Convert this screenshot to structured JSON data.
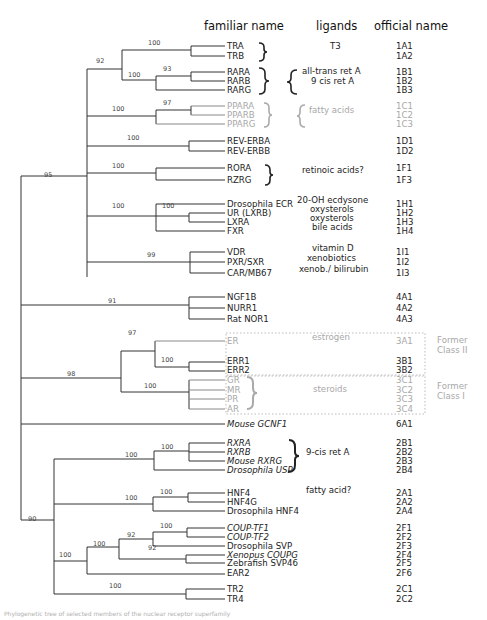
{
  "headers": {
    "familiar": "familiar name",
    "ligands": "ligands",
    "official": "official name"
  },
  "colors": {
    "line": "#333333",
    "gray": "#a8a8a8",
    "text": "#222222"
  },
  "leaves": [
    {
      "name": "TRA",
      "y": 46,
      "official": "1A1",
      "gray": false
    },
    {
      "name": "TRB",
      "y": 56,
      "official": "1A2",
      "gray": false
    },
    {
      "name": "RARA",
      "y": 72,
      "official": "1B1",
      "gray": false
    },
    {
      "name": "RARB",
      "y": 81,
      "official": "1B2",
      "gray": false
    },
    {
      "name": "RARG",
      "y": 90,
      "official": "1B3",
      "gray": false
    },
    {
      "name": "PPARA",
      "y": 106,
      "official": "1C1",
      "gray": true
    },
    {
      "name": "PPARB",
      "y": 115,
      "official": "1C2",
      "gray": true
    },
    {
      "name": "PPARG",
      "y": 124,
      "official": "1C3",
      "gray": true
    },
    {
      "name": "REV-ERBA",
      "y": 141,
      "official": "1D1",
      "gray": false
    },
    {
      "name": "REV-ERBB",
      "y": 151,
      "official": "1D2",
      "gray": false
    },
    {
      "name": "RORA",
      "y": 168,
      "official": "1F1",
      "gray": false
    },
    {
      "name": "RZRG",
      "y": 180,
      "official": "1F3",
      "gray": false
    },
    {
      "name": "Drosophila ECR",
      "y": 204,
      "official": "1H1",
      "gray": false
    },
    {
      "name": "UR (LXRB)",
      "y": 213,
      "official": "1H2",
      "gray": false
    },
    {
      "name": "LXRA",
      "y": 222,
      "official": "1H3",
      "gray": false
    },
    {
      "name": "FXR",
      "y": 231,
      "official": "1H4",
      "gray": false
    },
    {
      "name": "VDR",
      "y": 252,
      "official": "1I1",
      "gray": false
    },
    {
      "name": "PXR/SXR",
      "y": 262,
      "official": "1I2",
      "gray": false
    },
    {
      "name": "CAR/MB67",
      "y": 273,
      "official": "1I3",
      "gray": false
    },
    {
      "name": "NGF1B",
      "y": 297,
      "official": "4A1",
      "gray": false
    },
    {
      "name": "NURR1",
      "y": 308,
      "official": "4A2",
      "gray": false
    },
    {
      "name": "Rat NOR1",
      "y": 319,
      "official": "4A3",
      "gray": false
    },
    {
      "name": "ER",
      "y": 341,
      "official": "3A1",
      "gray": true
    },
    {
      "name": "ERR1",
      "y": 361,
      "official": "3B1",
      "gray": false
    },
    {
      "name": "ERR2",
      "y": 370,
      "official": "3B2",
      "gray": false
    },
    {
      "name": "GR",
      "y": 380,
      "official": "3C1",
      "gray": true
    },
    {
      "name": "MR",
      "y": 390,
      "official": "3C2",
      "gray": true
    },
    {
      "name": "PR",
      "y": 399,
      "official": "3C3",
      "gray": true
    },
    {
      "name": "AR",
      "y": 409,
      "official": "3C4",
      "gray": true
    },
    {
      "name": "Mouse GCNF1",
      "y": 424,
      "official": "6A1",
      "gray": false
    },
    {
      "name": "RXRA",
      "y": 443,
      "official": "2B1",
      "gray": false
    },
    {
      "name": "RXRB",
      "y": 452,
      "official": "2B2",
      "gray": false
    },
    {
      "name": "Mouse RXRG",
      "y": 461,
      "official": "2B3",
      "gray": false
    },
    {
      "name": "Drosophila USP",
      "y": 470,
      "official": "2B4",
      "gray": false
    },
    {
      "name": "HNF4",
      "y": 493,
      "official": "2A1",
      "gray": false
    },
    {
      "name": "HNF4G",
      "y": 502,
      "official": "2A2",
      "gray": false
    },
    {
      "name": "Drosophila HNF4",
      "y": 511,
      "official": "2A4",
      "gray": false
    },
    {
      "name": "COUP-TF1",
      "y": 528,
      "official": "2F1",
      "gray": false
    },
    {
      "name": "COUP-TF2",
      "y": 537,
      "official": "2F2",
      "gray": false
    },
    {
      "name": "Drosophila SVP",
      "y": 546,
      "official": "2F3",
      "gray": false
    },
    {
      "name": "Xenopus COUPG",
      "y": 555,
      "official": "2F4",
      "gray": false
    },
    {
      "name": "Zebrafish SVP46",
      "y": 563,
      "official": "2F5",
      "gray": false
    },
    {
      "name": "EAR2",
      "y": 573,
      "official": "2F6",
      "gray": false
    },
    {
      "name": "TR2",
      "y": 589,
      "official": "2C1",
      "gray": false
    },
    {
      "name": "TR4",
      "y": 599,
      "official": "2C2",
      "gray": false
    }
  ],
  "ligands": [
    {
      "text": "T3",
      "x": 330,
      "y": 46,
      "gray": false
    },
    {
      "text": "all-trans ret A",
      "x": 302,
      "y": 71,
      "gray": false
    },
    {
      "text": "9 cis ret A",
      "x": 311,
      "y": 81,
      "gray": false
    },
    {
      "text": "fatty acids",
      "x": 309,
      "y": 110,
      "gray": true
    },
    {
      "text": "retinoic acids?",
      "x": 302,
      "y": 170,
      "gray": false
    },
    {
      "text": "20-OH ecdysone",
      "x": 297,
      "y": 200,
      "gray": false
    },
    {
      "text": "oxysterols",
      "x": 310,
      "y": 209,
      "gray": false
    },
    {
      "text": "oxysterols",
      "x": 310,
      "y": 218,
      "gray": false
    },
    {
      "text": "bile acids",
      "x": 312,
      "y": 227,
      "gray": false
    },
    {
      "text": "vitamin D",
      "x": 312,
      "y": 248,
      "gray": false
    },
    {
      "text": "xenobiotics",
      "x": 307,
      "y": 258,
      "gray": false
    },
    {
      "text": "xenob./ bilirubin",
      "x": 299,
      "y": 269,
      "gray": false
    },
    {
      "text": "estrogen",
      "x": 312,
      "y": 337,
      "gray": true
    },
    {
      "text": "steroids",
      "x": 313,
      "y": 389,
      "gray": true
    },
    {
      "text": "9-cis ret A",
      "x": 306,
      "y": 452,
      "gray": false
    },
    {
      "text": "fatty acid?",
      "x": 306,
      "y": 490,
      "gray": false
    }
  ],
  "class_labels": [
    {
      "line1": "Former",
      "line2": "Class II",
      "x": 437,
      "y": 341
    },
    {
      "line1": "Former",
      "line2": "Class I",
      "x": 437,
      "y": 387
    }
  ],
  "bootstrap": [
    {
      "v": "100",
      "x": 153,
      "y": 42
    },
    {
      "v": "92",
      "x": 101,
      "y": 60
    },
    {
      "v": "93",
      "x": 168,
      "y": 68
    },
    {
      "v": "100",
      "x": 133,
      "y": 74
    },
    {
      "v": "97",
      "x": 168,
      "y": 102
    },
    {
      "v": "100",
      "x": 117,
      "y": 108
    },
    {
      "v": "100",
      "x": 132,
      "y": 137
    },
    {
      "v": "100",
      "x": 117,
      "y": 165
    },
    {
      "v": "95",
      "x": 49,
      "y": 174
    },
    {
      "v": "100",
      "x": 117,
      "y": 205
    },
    {
      "v": "100",
      "x": 167,
      "y": 205
    },
    {
      "v": "99",
      "x": 152,
      "y": 254
    },
    {
      "v": "91",
      "x": 113,
      "y": 300
    },
    {
      "v": "97",
      "x": 133,
      "y": 332
    },
    {
      "v": "100",
      "x": 166,
      "y": 359
    },
    {
      "v": "98",
      "x": 72,
      "y": 373
    },
    {
      "v": "100",
      "x": 149,
      "y": 385
    },
    {
      "v": "100",
      "x": 166,
      "y": 446
    },
    {
      "v": "100",
      "x": 130,
      "y": 454
    },
    {
      "v": "100",
      "x": 165,
      "y": 491
    },
    {
      "v": "100",
      "x": 130,
      "y": 497
    },
    {
      "v": "100",
      "x": 165,
      "y": 525
    },
    {
      "v": "92",
      "x": 132,
      "y": 534
    },
    {
      "v": "100",
      "x": 98,
      "y": 543
    },
    {
      "v": "92",
      "x": 153,
      "y": 547
    },
    {
      "v": "90",
      "x": 33,
      "y": 518
    },
    {
      "v": "100",
      "x": 64,
      "y": 554
    },
    {
      "v": "100",
      "x": 114,
      "y": 585
    }
  ],
  "caption": "Phylogenetic tree of selected members of the nuclear receptor superfamily"
}
